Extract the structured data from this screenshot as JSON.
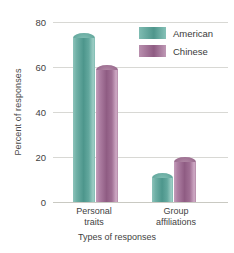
{
  "chart_data": {
    "type": "bar",
    "title": "",
    "xlabel": "Types of responses",
    "ylabel": "Percent of responses",
    "categories": [
      "Personal traits",
      "Group affiliations"
    ],
    "category_lines": [
      [
        "Personal",
        "traits"
      ],
      [
        "Group",
        "affiliations"
      ]
    ],
    "series": [
      {
        "name": "American",
        "color": "#5fa89f",
        "values": [
          75,
          13
        ]
      },
      {
        "name": "Chinese",
        "color": "#a5739a",
        "values": [
          61,
          20
        ]
      }
    ],
    "ylim": [
      0,
      80
    ],
    "yticks": [
      0,
      20,
      40,
      60,
      80
    ],
    "ytick_labels": [
      "0",
      "20",
      "40",
      "60",
      "80"
    ],
    "grid": true,
    "legend_position": "top-right"
  },
  "axes": {
    "y_title": "Percent of responses",
    "x_title": "Types of responses",
    "y_labels": {
      "t80": "80",
      "t60": "60",
      "t40": "40",
      "t20": "20",
      "t0": "0"
    }
  },
  "legend": {
    "items": [
      {
        "label": "American",
        "color": "#5fa89f"
      },
      {
        "label": "Chinese",
        "color": "#a5739a"
      }
    ]
  },
  "groups": [
    {
      "line1": "Personal",
      "line2": "traits"
    },
    {
      "line1": "Group",
      "line2": "affiliations"
    }
  ]
}
